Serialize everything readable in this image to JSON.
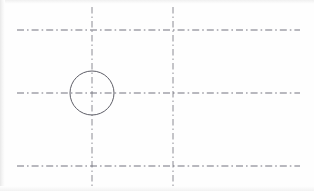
{
  "sheet": {
    "title": "Engineering centerline layout drawing",
    "width": 314,
    "height": 191,
    "background_color": "#fefefe",
    "line_color": "#5b5b68",
    "circle_color": "#55555f",
    "line_style": "dash-dot centerline",
    "scan_edge_color": "#e8e8e8"
  },
  "geometry": {
    "horizontal_centerlines": [
      {
        "name": "top-horizontal-centerline",
        "y": 30,
        "x1": 17,
        "x2": 300
      },
      {
        "name": "middle-horizontal-centerline",
        "y": 93,
        "x1": 17,
        "x2": 300
      },
      {
        "name": "bottom-horizontal-centerline",
        "y": 166,
        "x1": 17,
        "x2": 300
      }
    ],
    "vertical_centerlines": [
      {
        "name": "left-vertical-centerline",
        "x": 92,
        "y1": 7,
        "y2": 186
      },
      {
        "name": "right-vertical-centerline",
        "x": 173,
        "y1": 7,
        "y2": 186
      }
    ],
    "circles": [
      {
        "name": "hole-circle",
        "cx": 92,
        "cy": 93,
        "r": 22
      }
    ],
    "intersections": [
      {
        "name": "intersection-left-top",
        "x": 92,
        "y": 30
      },
      {
        "name": "intersection-left-middle",
        "x": 92,
        "y": 93
      },
      {
        "name": "intersection-left-bottom",
        "x": 92,
        "y": 166
      },
      {
        "name": "intersection-right-top",
        "x": 173,
        "y": 30
      },
      {
        "name": "intersection-right-middle",
        "x": 173,
        "y": 93
      },
      {
        "name": "intersection-right-bottom",
        "x": 173,
        "y": 166
      }
    ]
  }
}
